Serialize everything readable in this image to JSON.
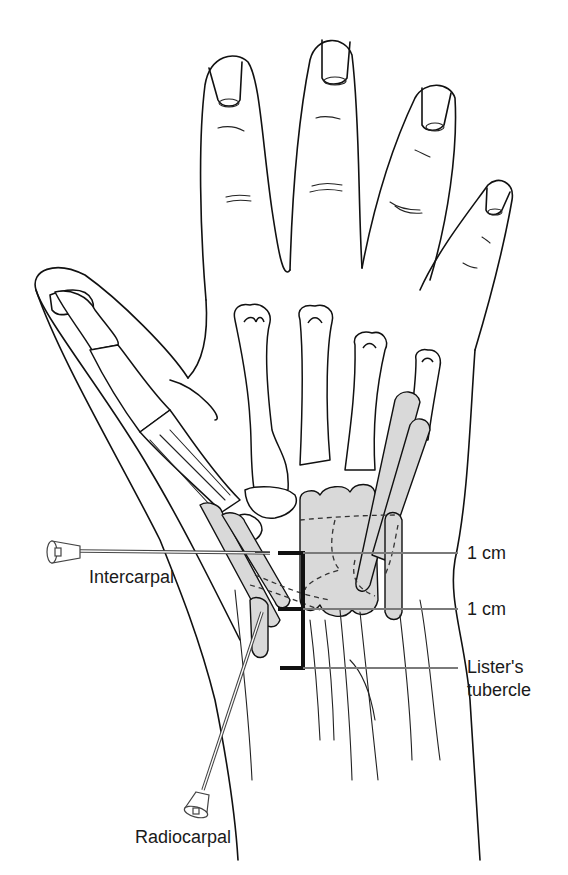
{
  "figure": {
    "colors": {
      "line": "#111111",
      "shading": "#d9d9d9",
      "leader": "#7a7a7a",
      "background": "#ffffff"
    }
  },
  "labels": {
    "intercarpal": "Intercarpal",
    "radiocarpal": "Radiocarpal",
    "cm_upper": "1 cm",
    "cm_lower": "1 cm",
    "listers_line1": "Lister's",
    "listers_line2": "tubercle"
  },
  "icons": {
    "intercarpal_needle": "syringe-needle-icon",
    "radiocarpal_needle": "syringe-needle-icon"
  }
}
